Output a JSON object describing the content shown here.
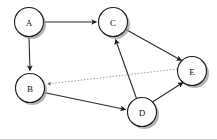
{
  "figure": {
    "width": 217,
    "height": 140,
    "background_color": "#ffffff",
    "node_fill": "#ffffff",
    "node_stroke": "#1a1a1a",
    "shadow_color": "#9a9a9a",
    "solid_edge_color": "#2b2b2b",
    "dotted_edge_color": "#8a8a8a"
  },
  "graph": {
    "nodes": [
      {
        "id": "A",
        "label": "A",
        "cx": 29,
        "cy": 22,
        "r": 14.5
      },
      {
        "id": "B",
        "label": "B",
        "cx": 30,
        "cy": 88,
        "r": 14.5
      },
      {
        "id": "C",
        "label": "C",
        "cx": 113,
        "cy": 22,
        "r": 14.5
      },
      {
        "id": "D",
        "label": "D",
        "cx": 142,
        "cy": 112,
        "r": 14.5
      },
      {
        "id": "E",
        "label": "E",
        "cx": 192,
        "cy": 71,
        "r": 14.5
      }
    ],
    "edges": [
      {
        "id": "A-C",
        "from": "A",
        "to": "C",
        "style": "solid",
        "directed": true,
        "arrow_at": "C"
      },
      {
        "id": "A-B",
        "from": "A",
        "to": "B",
        "style": "solid",
        "directed": true,
        "arrow_at": "B"
      },
      {
        "id": "C-E",
        "from": "C",
        "to": "E",
        "style": "solid",
        "directed": true,
        "arrow_at": "E"
      },
      {
        "id": "D-C",
        "from": "D",
        "to": "C",
        "style": "solid",
        "directed": true,
        "arrow_at": "C"
      },
      {
        "id": "B-D",
        "from": "B",
        "to": "D",
        "style": "solid",
        "directed": true,
        "arrow_at": "D"
      },
      {
        "id": "D-E",
        "from": "D",
        "to": "E",
        "style": "solid",
        "directed": true,
        "arrow_at": "E"
      },
      {
        "id": "E-B",
        "from": "E",
        "to": "B",
        "style": "dotted",
        "directed": true,
        "arrow_at": "B"
      }
    ]
  }
}
